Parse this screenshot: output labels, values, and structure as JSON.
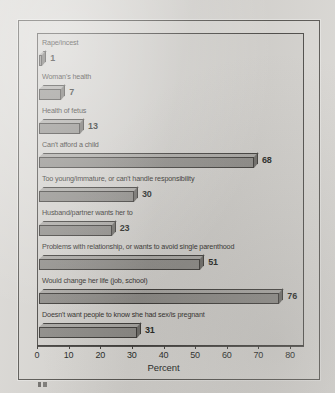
{
  "chart_data": {
    "type": "bar",
    "orientation": "horizontal",
    "title": "",
    "xlabel": "Percent",
    "ylabel": "",
    "xlim": [
      0,
      80
    ],
    "xticks": [
      0,
      10,
      20,
      30,
      40,
      50,
      60,
      70,
      80
    ],
    "grid": false,
    "legend": null,
    "categories": [
      "Rape/incest",
      "Woman's health",
      "Health of fetus",
      "Can't afford a child",
      "Too young/immature, or can't handle responsibility",
      "Husband/partner wants her to",
      "Problems with relationship, or wants to avoid single parenthood",
      "Would change her life (job, school)",
      "Doesn't want people to know she had sex/is pregnant"
    ],
    "values": [
      1,
      7,
      13,
      68,
      30,
      23,
      51,
      76,
      31
    ],
    "value_labels": [
      "1",
      "7",
      "13",
      "68",
      "30",
      "23",
      "51",
      "76",
      "31"
    ],
    "bar_style": "3d-extruded",
    "colors": {
      "bar_front": "#8d8b87",
      "bar_top": "#a9a7a3",
      "bar_side": "#6d6b67",
      "bar_outline": "#3a3835",
      "plot_background": "#d4d2ce",
      "figure_background": "#dbd9d5",
      "page_background": "#d9d7d3",
      "axis": "#3d3b38",
      "text": "#201e1c"
    }
  }
}
